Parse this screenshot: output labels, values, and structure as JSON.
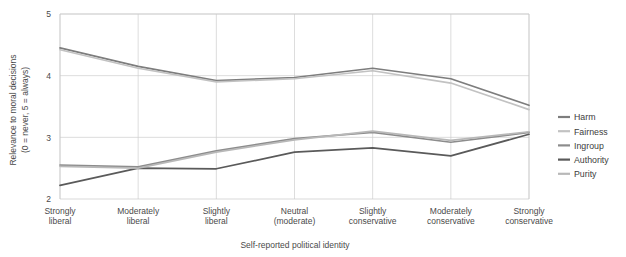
{
  "chart_data": {
    "type": "line",
    "title": "",
    "xlabel": "Self-reported political identity",
    "ylabel": "Relevance to moral decisions\n(0 = never, 5 = always)",
    "ylabel_line1": "Relevance to moral decisions",
    "ylabel_line2": "(0 = never, 5 = always)",
    "ylim": [
      2,
      5
    ],
    "yticks": [
      2,
      3,
      4,
      5
    ],
    "ytick_labels": [
      "2",
      "3",
      "4",
      "5"
    ],
    "grid": true,
    "legend_position": "right",
    "categories": [
      "Strongly liberal",
      "Moderately liberal",
      "Slightly liberal",
      "Neutral (moderate)",
      "Slightly conservative",
      "Moderately conservative",
      "Strongly conservative"
    ],
    "category_lines": [
      [
        "Strongly",
        "liberal"
      ],
      [
        "Moderately",
        "liberal"
      ],
      [
        "Slightly",
        "liberal"
      ],
      [
        "Neutral",
        "(moderate)"
      ],
      [
        "Slightly",
        "conservative"
      ],
      [
        "Moderately",
        "conservative"
      ],
      [
        "Strongly",
        "conservative"
      ]
    ],
    "series": [
      {
        "name": "Harm",
        "color": "#7d7d7d",
        "values": [
          4.45,
          4.15,
          3.92,
          3.97,
          4.12,
          3.95,
          3.52
        ]
      },
      {
        "name": "Fairness",
        "color": "#c2c2c2",
        "values": [
          4.42,
          4.12,
          3.9,
          3.95,
          4.08,
          3.88,
          3.45
        ]
      },
      {
        "name": "Ingroup",
        "color": "#8c8c8c",
        "values": [
          2.55,
          2.52,
          2.78,
          2.98,
          3.08,
          2.92,
          3.08
        ]
      },
      {
        "name": "Authority",
        "color": "#5a5a5a",
        "values": [
          2.22,
          2.5,
          2.49,
          2.76,
          2.83,
          2.7,
          3.05
        ]
      },
      {
        "name": "Purity",
        "color": "#b8b8b8",
        "values": [
          2.53,
          2.5,
          2.76,
          2.96,
          3.1,
          2.95,
          3.09
        ]
      }
    ]
  },
  "legend": {
    "items": [
      {
        "label": "Harm"
      },
      {
        "label": "Fairness"
      },
      {
        "label": "Ingroup"
      },
      {
        "label": "Authority"
      },
      {
        "label": "Purity"
      }
    ]
  },
  "colors": {
    "grid": "#cfcfcf",
    "frame": "#c8c8c8",
    "text": "#4a4a4a",
    "background": "#ffffff"
  }
}
